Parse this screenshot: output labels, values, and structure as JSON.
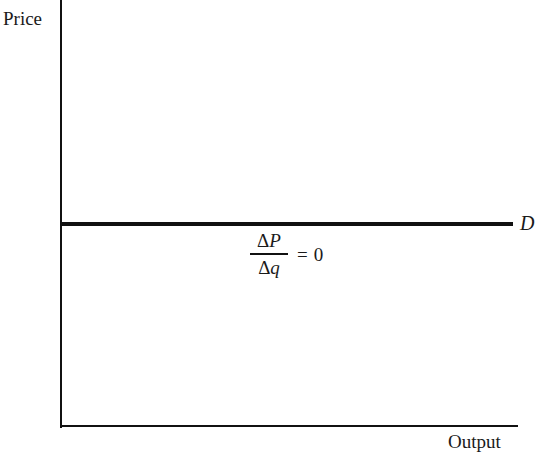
{
  "chart_data": {
    "type": "line",
    "title": "",
    "xlabel": "Output",
    "ylabel": "Price",
    "grid": false,
    "legend": "none",
    "series": [
      {
        "name": "D",
        "label": "D",
        "description": "Perfectly elastic (horizontal) demand curve facing a price-taking firm",
        "x": [
          0,
          100
        ],
        "y": [
          50,
          50
        ]
      }
    ],
    "xlim": [
      0,
      100
    ],
    "ylim": [
      0,
      100
    ],
    "annotations": [
      {
        "name": "slope-annotation",
        "numerator": "ΔP",
        "numerator_delta": "Δ",
        "numerator_var": "P",
        "denominator": "Δq",
        "denominator_delta": "Δ",
        "denominator_var": "q",
        "operator": "=",
        "value": "0",
        "text": "ΔP/Δq = 0"
      }
    ],
    "colors": {
      "axis": "#111111",
      "curve": "#111111",
      "background": "#ffffff",
      "text": "#1a1a1a"
    }
  },
  "figure": {
    "axis_label_y": "Price",
    "axis_label_x": "Output",
    "curve_label": "D",
    "slope": {
      "delta": "Δ",
      "numerator_var": "P",
      "denominator_var": "q",
      "equals": "=",
      "value": "0"
    }
  }
}
